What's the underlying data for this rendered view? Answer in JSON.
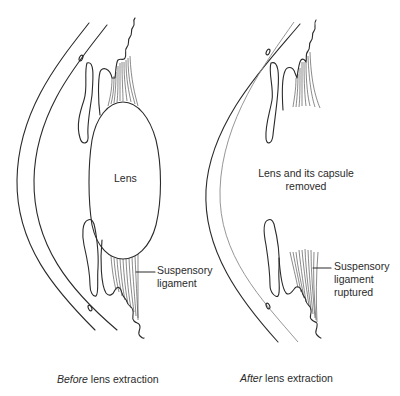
{
  "diagram": {
    "panels": [
      {
        "id": "before",
        "labels": {
          "lens": "Lens",
          "ligament_line1": "Suspensory",
          "ligament_line2": "ligament"
        },
        "caption": {
          "emphasis": "Before",
          "rest": " lens extraction"
        }
      },
      {
        "id": "after",
        "labels": {
          "removed_line1": "Lens and its capsule",
          "removed_line2": "removed",
          "ligament_line1": "Suspensory",
          "ligament_line2": "ligament",
          "ligament_line3": "ruptured"
        },
        "caption": {
          "emphasis": "After",
          "rest": " lens extraction"
        }
      }
    ],
    "colors": {
      "line": "#2a2a2a",
      "light_line": "#8a8a8a",
      "background": "#ffffff"
    }
  }
}
